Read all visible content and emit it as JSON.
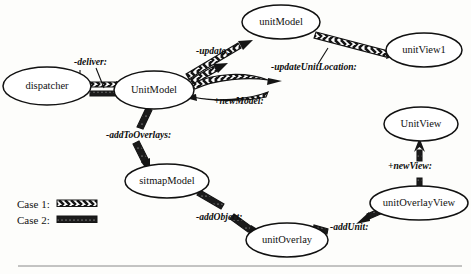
{
  "diagram": {
    "nodes": [
      {
        "id": "dispatcher",
        "label": "dispatcher",
        "cx": 47,
        "cy": 86,
        "rx": 44,
        "ry": 19
      },
      {
        "id": "UnitModel",
        "label": "UnitModel",
        "cx": 154,
        "cy": 90,
        "rx": 40,
        "ry": 19
      },
      {
        "id": "unitModel",
        "label": "unitModel",
        "cx": 281,
        "cy": 22,
        "rx": 39,
        "ry": 17
      },
      {
        "id": "unitView1",
        "label": "unitView1",
        "cx": 424,
        "cy": 50,
        "rx": 38,
        "ry": 17
      },
      {
        "id": "UnitView",
        "label": "UnitView",
        "cx": 421,
        "cy": 124,
        "rx": 37,
        "ry": 17
      },
      {
        "id": "unitOverlayView",
        "label": "unitOverlayView",
        "cx": 419,
        "cy": 203,
        "rx": 49,
        "ry": 17
      },
      {
        "id": "sitmapModel",
        "label": "sitmapModel",
        "cx": 167,
        "cy": 181,
        "rx": 42,
        "ry": 17
      },
      {
        "id": "unitOverlay",
        "label": "unitOverlay",
        "cx": 287,
        "cy": 240,
        "rx": 41,
        "ry": 17
      }
    ],
    "edge_labels": [
      {
        "id": "deliver",
        "text": "-deliver:",
        "x": 74,
        "y": 65
      },
      {
        "id": "update",
        "text": "-update:",
        "x": 196,
        "y": 54
      },
      {
        "id": "updateUnitLocation",
        "text": "-updateUnitLocation:",
        "x": 271,
        "y": 70
      },
      {
        "id": "newModel",
        "text": "+newModel:",
        "x": 214,
        "y": 104
      },
      {
        "id": "addToOverlays",
        "text": "-addToOverlays:",
        "x": 106,
        "y": 138
      },
      {
        "id": "newView",
        "text": "+newView:",
        "x": 388,
        "y": 169
      },
      {
        "id": "addObject",
        "text": "-addObject:",
        "x": 196,
        "y": 220
      },
      {
        "id": "addUnit",
        "text": "-addUnit:",
        "x": 330,
        "y": 230
      }
    ],
    "legend": {
      "items": [
        {
          "id": "case-1",
          "label": "Case 1:",
          "style": "hatched-chevron"
        },
        {
          "id": "case-2",
          "label": "Case 2:",
          "style": "solid-bar"
        }
      ]
    }
  }
}
